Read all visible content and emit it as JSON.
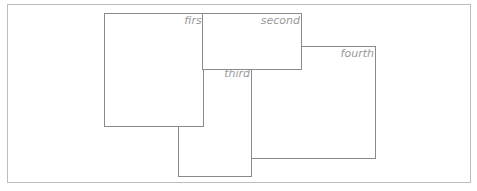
{
  "diagram": {
    "frame": {
      "x": 7,
      "y": 4,
      "width": 465,
      "height": 180
    },
    "boxes": [
      {
        "id": "fourth",
        "label": "fourth",
        "x": 251,
        "y": 46,
        "width": 125,
        "height": 113,
        "z": 1
      },
      {
        "id": "third",
        "label": "third",
        "x": 178,
        "y": 64,
        "width": 74,
        "height": 113,
        "z": 2
      },
      {
        "id": "first",
        "label": "first",
        "x": 104,
        "y": 13,
        "width": 100,
        "height": 114,
        "z": 3
      },
      {
        "id": "second",
        "label": "second",
        "x": 202,
        "y": 13,
        "width": 100,
        "height": 57,
        "z": 4
      }
    ],
    "colors": {
      "border": "#8a8a8a",
      "label": "#9a9a9a",
      "frame": "#bdbdbd",
      "background": "#ffffff"
    }
  }
}
